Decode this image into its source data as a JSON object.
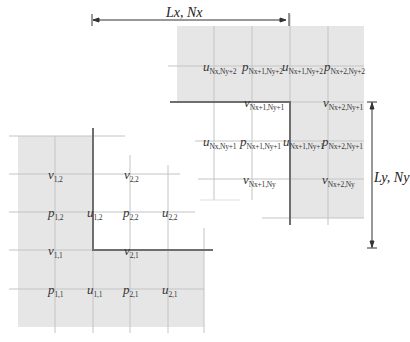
{
  "diagram": {
    "dimensions": {
      "horizontal": "Lx, Nx",
      "vertical": "Ly, Ny"
    },
    "colors": {
      "shade": "#e6e6e6",
      "grid": "#c4c4c4",
      "wall": "#6e6e6e",
      "arrow": "#333333"
    },
    "bottom_left_corner": {
      "labels": [
        {
          "var": "v",
          "sub": "1,2"
        },
        {
          "var": "v",
          "sub": "2,2"
        },
        {
          "var": "p",
          "sub": "1,2"
        },
        {
          "var": "u",
          "sub": "1,2"
        },
        {
          "var": "p",
          "sub": "2,2"
        },
        {
          "var": "u",
          "sub": "2,2"
        },
        {
          "var": "v",
          "sub": "1,1"
        },
        {
          "var": "v",
          "sub": "2,1"
        },
        {
          "var": "p",
          "sub": "1,1"
        },
        {
          "var": "u",
          "sub": "1,1"
        },
        {
          "var": "p",
          "sub": "2,1"
        },
        {
          "var": "u",
          "sub": "2,1"
        }
      ]
    },
    "top_right_corner": {
      "labels": [
        {
          "var": "u",
          "sub": "Nx,Ny+2"
        },
        {
          "var": "p",
          "sub": "Nx+1,Ny+2"
        },
        {
          "var": "u",
          "sub": "Nx+1,Ny+2"
        },
        {
          "var": "p",
          "sub": "Nx+2,Ny+2"
        },
        {
          "var": "v",
          "sub": "Nx+1,Ny+1"
        },
        {
          "var": "v",
          "sub": "Nx+2,Ny+1"
        },
        {
          "var": "u",
          "sub": "Nx,Ny+1"
        },
        {
          "var": "p",
          "sub": "Nx+1,Ny+1"
        },
        {
          "var": "u",
          "sub": "Nx+1,Ny+1"
        },
        {
          "var": "p",
          "sub": "Nx+2,Ny+1"
        },
        {
          "var": "v",
          "sub": "Nx+1,Ny"
        },
        {
          "var": "v",
          "sub": "Nx+2,Ny"
        }
      ]
    }
  }
}
